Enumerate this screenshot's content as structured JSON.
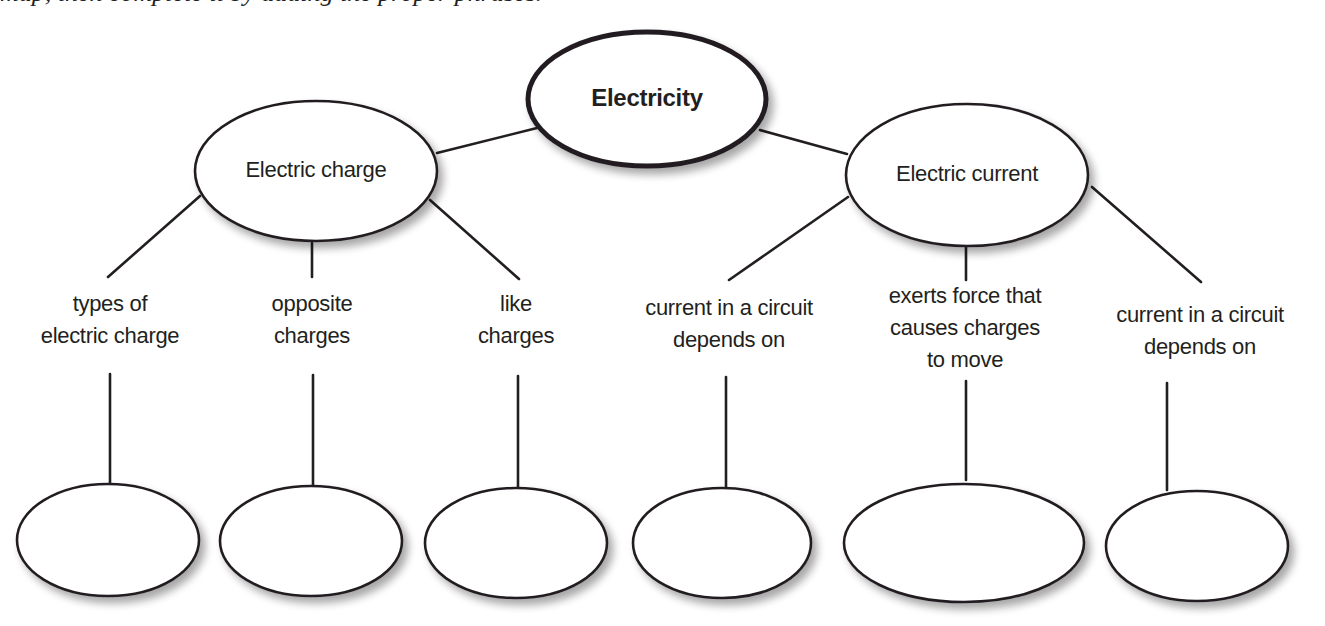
{
  "header": {
    "clipped_text": "map, then complete it by adding the proper phrases."
  },
  "concept_map": {
    "root": {
      "label": "Electricity"
    },
    "branches": [
      {
        "label": "Electric charge",
        "links": [
          {
            "lines": [
              "types of",
              "electric charge"
            ],
            "answer": ""
          },
          {
            "lines": [
              "opposite",
              "charges"
            ],
            "answer": ""
          },
          {
            "lines": [
              "like",
              "charges"
            ],
            "answer": ""
          }
        ]
      },
      {
        "label": "Electric current",
        "links": [
          {
            "lines": [
              "current in a circuit",
              "depends on"
            ],
            "answer": ""
          },
          {
            "lines": [
              "exerts force that",
              "causes charges",
              "to move"
            ],
            "answer": ""
          },
          {
            "lines": [
              "current in a circuit",
              "depends on"
            ],
            "answer": ""
          }
        ]
      }
    ]
  },
  "colors": {
    "stroke": "#231f20",
    "fill": "#ffffff",
    "shadow": "#9a9a9a"
  }
}
